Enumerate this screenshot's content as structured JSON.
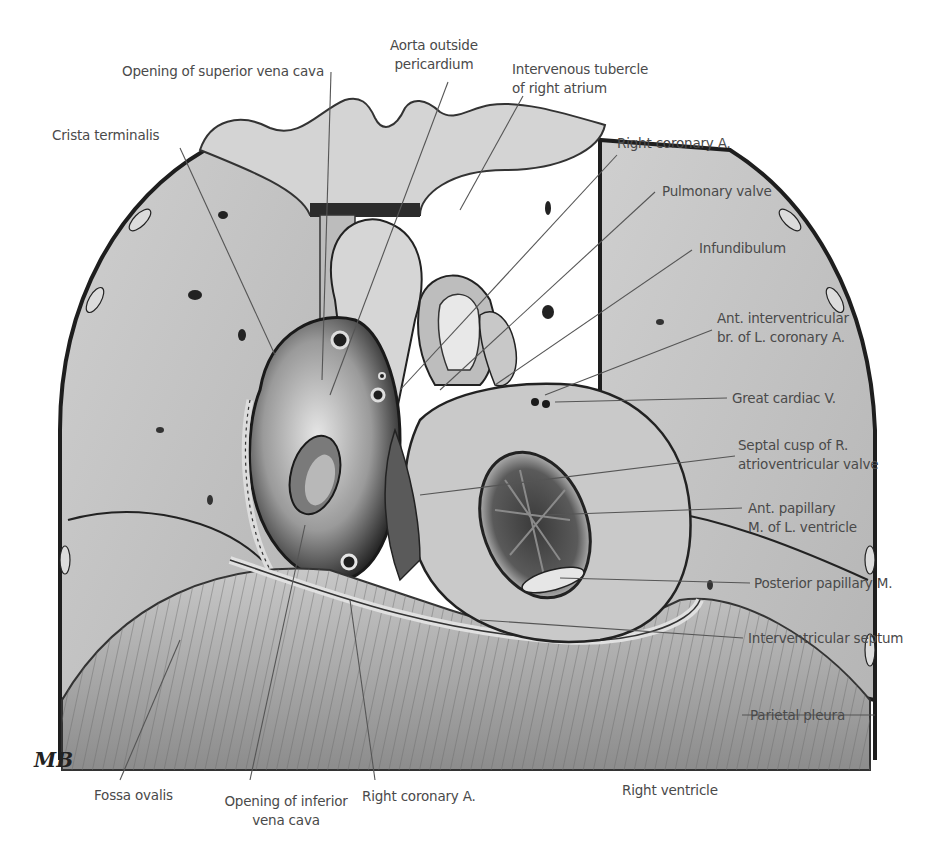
{
  "figure": {
    "signature": "MB",
    "palette": {
      "background": "#ffffff",
      "lung": "#c4c4c4",
      "lung_dark": "#a8a8a8",
      "pericardium": "#d8d8d8",
      "diaphragm": "#b8b8b8",
      "heart_light": "#d0d0d0",
      "heart_dark": "#2a2a2a",
      "leader_line": "#555555",
      "label_text": "#4a4a4a"
    }
  },
  "labels": {
    "left": [
      {
        "id": "crista-terminalis",
        "lines": [
          "Crista terminalis"
        ]
      }
    ],
    "top": [
      {
        "id": "opening-superior-vena-cava",
        "lines": [
          "Opening of superior vena cava"
        ]
      },
      {
        "id": "aorta-outside-pericardium",
        "lines": [
          "Aorta outside",
          "pericardium"
        ]
      },
      {
        "id": "intervenous-tubercle",
        "lines": [
          "Intervenous tubercle",
          "of right atrium"
        ]
      }
    ],
    "right": [
      {
        "id": "right-coronary-a-upper",
        "lines": [
          "Right coronary A."
        ]
      },
      {
        "id": "pulmonary-valve",
        "lines": [
          "Pulmonary valve"
        ]
      },
      {
        "id": "infundibulum",
        "lines": [
          "Infundibulum"
        ]
      },
      {
        "id": "ant-interventricular-br",
        "lines": [
          "Ant. interventricular",
          "br. of L. coronary A."
        ]
      },
      {
        "id": "great-cardiac-v",
        "lines": [
          "Great cardiac V."
        ]
      },
      {
        "id": "septal-cusp",
        "lines": [
          "Septal cusp of R.",
          "atrioventricular valve"
        ]
      },
      {
        "id": "ant-papillary-m",
        "lines": [
          "Ant. papillary",
          "M. of L. ventricle"
        ]
      },
      {
        "id": "posterior-papillary-m",
        "lines": [
          "Posterior papillary M."
        ]
      },
      {
        "id": "interventricular-septum",
        "lines": [
          "Interventricular septum"
        ]
      },
      {
        "id": "parietal-pleura",
        "lines": [
          "Parietal pleura"
        ]
      }
    ],
    "bottom": [
      {
        "id": "fossa-ovalis",
        "lines": [
          "Fossa ovalis"
        ]
      },
      {
        "id": "opening-inferior-vena-cava",
        "lines": [
          "Opening of inferior",
          "vena cava"
        ]
      },
      {
        "id": "right-coronary-a-lower",
        "lines": [
          "Right coronary A."
        ]
      },
      {
        "id": "right-ventricle",
        "lines": [
          "Right ventricle"
        ]
      }
    ]
  }
}
